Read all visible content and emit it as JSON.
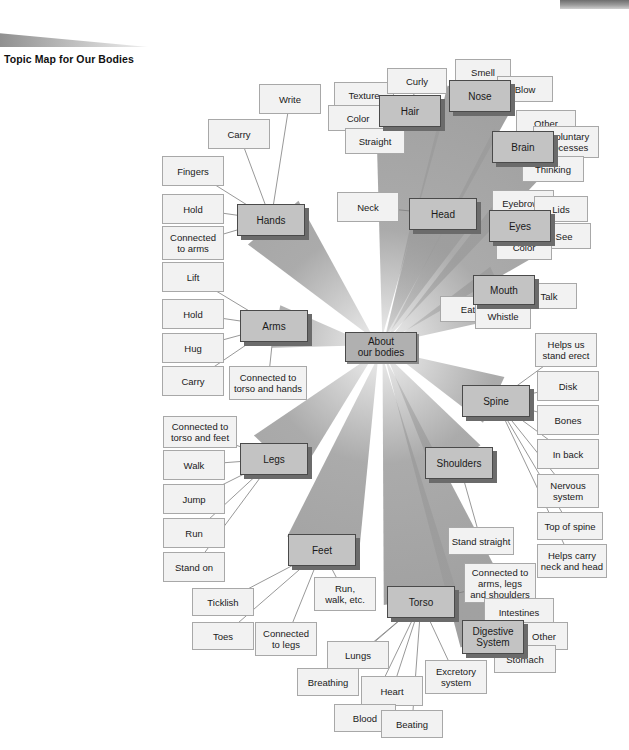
{
  "page": {
    "title": "Topic Map for Our Bodies",
    "decor": {
      "top_bar": "gray-gradient-bar",
      "swoosh": "gray-swoosh"
    }
  },
  "colors": {
    "center_fill": "#b0b0b0",
    "major_fill": "#c3c3c3",
    "leaf_fill": "#f2f2f2",
    "major_border": "#4a4a4a",
    "leaf_border": "#a8a8a8",
    "ray_fill": "#9c9c9c",
    "shadow": "#6b6b6b"
  },
  "map": {
    "type": "radial-topic-map",
    "center": {
      "label": "About\nour bodies",
      "x": 345,
      "y": 332,
      "w": 72,
      "h": 30
    },
    "branches": [
      {
        "label": "Hands",
        "x": 237,
        "y": 204,
        "w": 68,
        "h": 32,
        "children": [
          {
            "label": "Write",
            "x": 259,
            "y": 84,
            "w": 62,
            "h": 30
          },
          {
            "label": "Carry",
            "x": 208,
            "y": 119,
            "w": 62,
            "h": 30
          },
          {
            "label": "Fingers",
            "x": 162,
            "y": 156,
            "w": 62,
            "h": 30
          },
          {
            "label": "Hold",
            "x": 162,
            "y": 194,
            "w": 62,
            "h": 30
          },
          {
            "label": "Connected\nto arms",
            "x": 162,
            "y": 226,
            "w": 62,
            "h": 34
          }
        ]
      },
      {
        "label": "Arms",
        "x": 240,
        "y": 310,
        "w": 68,
        "h": 32,
        "children": [
          {
            "label": "Lift",
            "x": 162,
            "y": 262,
            "w": 62,
            "h": 30
          },
          {
            "label": "Hold",
            "x": 162,
            "y": 299,
            "w": 62,
            "h": 30
          },
          {
            "label": "Hug",
            "x": 162,
            "y": 333,
            "w": 62,
            "h": 30
          },
          {
            "label": "Carry",
            "x": 162,
            "y": 366,
            "w": 62,
            "h": 30
          },
          {
            "label": "Connected to\ntorso and hands",
            "x": 229,
            "y": 366,
            "w": 78,
            "h": 34
          }
        ]
      },
      {
        "label": "Legs",
        "x": 240,
        "y": 443,
        "w": 68,
        "h": 32,
        "children": [
          {
            "label": "Connected to\ntorso and feet",
            "x": 163,
            "y": 416,
            "w": 74,
            "h": 32
          },
          {
            "label": "Walk",
            "x": 163,
            "y": 450,
            "w": 62,
            "h": 30
          },
          {
            "label": "Jump",
            "x": 163,
            "y": 484,
            "w": 62,
            "h": 30
          },
          {
            "label": "Run",
            "x": 163,
            "y": 518,
            "w": 62,
            "h": 30
          },
          {
            "label": "Stand on",
            "x": 163,
            "y": 552,
            "w": 62,
            "h": 30
          }
        ]
      },
      {
        "label": "Feet",
        "x": 288,
        "y": 534,
        "w": 68,
        "h": 32,
        "children": [
          {
            "label": "Ticklish",
            "x": 192,
            "y": 588,
            "w": 62,
            "h": 28
          },
          {
            "label": "Toes",
            "x": 192,
            "y": 622,
            "w": 62,
            "h": 28
          },
          {
            "label": "Connected\nto legs",
            "x": 255,
            "y": 622,
            "w": 62,
            "h": 34
          },
          {
            "label": "Run,\nwalk, etc.",
            "x": 314,
            "y": 577,
            "w": 62,
            "h": 34
          }
        ]
      },
      {
        "label": "Torso",
        "x": 387,
        "y": 586,
        "w": 68,
        "h": 32,
        "children": [
          {
            "label": "Connected to\narms, legs\nand shoulders",
            "x": 464,
            "y": 563,
            "w": 72,
            "h": 40
          },
          {
            "label": "Lungs",
            "x": 327,
            "y": 641,
            "w": 62,
            "h": 28
          },
          {
            "label": "Breathing",
            "x": 297,
            "y": 668,
            "w": 62,
            "h": 28
          },
          {
            "label": "Heart",
            "x": 361,
            "y": 676,
            "w": 62,
            "h": 30
          },
          {
            "label": "Blood",
            "x": 334,
            "y": 704,
            "w": 62,
            "h": 28
          },
          {
            "label": "Beating",
            "x": 381,
            "y": 710,
            "w": 62,
            "h": 28
          },
          {
            "label": "Excretory\nsystem",
            "x": 425,
            "y": 660,
            "w": 62,
            "h": 34
          }
        ]
      },
      {
        "label": "Digestive\nSystem",
        "x": 462,
        "y": 620,
        "w": 62,
        "h": 34,
        "children": [
          {
            "label": "Intestines",
            "x": 484,
            "y": 598,
            "w": 70,
            "h": 28
          },
          {
            "label": "Other",
            "x": 520,
            "y": 622,
            "w": 48,
            "h": 28
          },
          {
            "label": "Stomach",
            "x": 494,
            "y": 645,
            "w": 62,
            "h": 28
          }
        ]
      },
      {
        "label": "Shoulders",
        "x": 425,
        "y": 447,
        "w": 68,
        "h": 32,
        "children": [
          {
            "label": "Stand straight",
            "x": 448,
            "y": 527,
            "w": 66,
            "h": 28
          }
        ]
      },
      {
        "label": "Spine",
        "x": 462,
        "y": 385,
        "w": 68,
        "h": 32,
        "children": [
          {
            "label": "Helps us\nstand erect",
            "x": 535,
            "y": 333,
            "w": 62,
            "h": 34
          },
          {
            "label": "Disk",
            "x": 537,
            "y": 371,
            "w": 62,
            "h": 30
          },
          {
            "label": "Bones",
            "x": 537,
            "y": 405,
            "w": 62,
            "h": 30
          },
          {
            "label": "In back",
            "x": 537,
            "y": 439,
            "w": 62,
            "h": 30
          },
          {
            "label": "Nervous\nsystem",
            "x": 537,
            "y": 474,
            "w": 62,
            "h": 34
          },
          {
            "label": "Top of spine",
            "x": 537,
            "y": 512,
            "w": 66,
            "h": 28
          },
          {
            "label": "Helps carry\nneck and head",
            "x": 537,
            "y": 544,
            "w": 70,
            "h": 34
          }
        ]
      },
      {
        "label": "Head",
        "x": 409,
        "y": 198,
        "w": 68,
        "h": 32,
        "children": [
          {
            "label": "Neck",
            "x": 337,
            "y": 192,
            "w": 62,
            "h": 30
          }
        ]
      },
      {
        "label": "Hair",
        "x": 379,
        "y": 95,
        "w": 62,
        "h": 32,
        "children": [
          {
            "label": "Texture",
            "x": 334,
            "y": 82,
            "w": 60,
            "h": 26
          },
          {
            "label": "Curly",
            "x": 387,
            "y": 68,
            "w": 60,
            "h": 26
          },
          {
            "label": "Color",
            "x": 328,
            "y": 105,
            "w": 60,
            "h": 26
          },
          {
            "label": "Straight",
            "x": 345,
            "y": 128,
            "w": 60,
            "h": 26
          }
        ]
      },
      {
        "label": "Nose",
        "x": 449,
        "y": 80,
        "w": 62,
        "h": 32,
        "children": [
          {
            "label": "Smell",
            "x": 455,
            "y": 59,
            "w": 56,
            "h": 26
          },
          {
            "label": "Blow",
            "x": 497,
            "y": 76,
            "w": 56,
            "h": 26
          }
        ]
      },
      {
        "label": "Brain",
        "x": 492,
        "y": 131,
        "w": 62,
        "h": 32,
        "children": [
          {
            "label": "Other",
            "x": 516,
            "y": 110,
            "w": 60,
            "h": 26
          },
          {
            "label": "Involuntary\nProcesses",
            "x": 533,
            "y": 126,
            "w": 66,
            "h": 32
          },
          {
            "label": "Thinking",
            "x": 522,
            "y": 156,
            "w": 62,
            "h": 26
          }
        ]
      },
      {
        "label": "Eyes",
        "x": 489,
        "y": 210,
        "w": 62,
        "h": 32,
        "children": [
          {
            "label": "Eyebrows",
            "x": 492,
            "y": 190,
            "w": 62,
            "h": 26
          },
          {
            "label": "Lids",
            "x": 534,
            "y": 196,
            "w": 54,
            "h": 26
          },
          {
            "label": "See",
            "x": 537,
            "y": 223,
            "w": 54,
            "h": 26
          },
          {
            "label": "Color",
            "x": 496,
            "y": 234,
            "w": 56,
            "h": 26
          }
        ]
      },
      {
        "label": "Mouth",
        "x": 473,
        "y": 275,
        "w": 62,
        "h": 30,
        "children": [
          {
            "label": "Eat",
            "x": 440,
            "y": 296,
            "w": 56,
            "h": 26
          },
          {
            "label": "Talk",
            "x": 521,
            "y": 283,
            "w": 56,
            "h": 26
          },
          {
            "label": "Whistle",
            "x": 475,
            "y": 303,
            "w": 56,
            "h": 26
          }
        ]
      }
    ]
  }
}
